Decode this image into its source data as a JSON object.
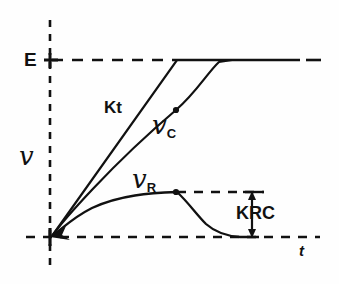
{
  "figure": {
    "background_color": "#fefefe",
    "ink_color": "#111111",
    "width": 339,
    "height": 284
  },
  "axes": {
    "y_axis": {
      "name": "vertical-dashed-axis",
      "label": "℘",
      "label_text": "v",
      "style": "dashed",
      "x": 50,
      "y_top": 20,
      "y_bottom": 268
    },
    "x_axis": {
      "name": "horizontal-dashed-axis",
      "label": "t",
      "style": "dashed",
      "y": 237,
      "x_left": 26,
      "x_right": 320
    },
    "ticks": [
      {
        "name": "tick-E",
        "label": "E",
        "value_y": 60
      },
      {
        "name": "tick-origin",
        "label": "",
        "value_y": 237
      }
    ]
  },
  "levels": {
    "E": {
      "label": "E",
      "y": 60,
      "dashed_from_x": 50,
      "dashed_to_x": 177,
      "solid_from_x": 177,
      "solid_to_x": 300,
      "tail_dash_from_x": 305,
      "tail_dash_to_x": 320
    },
    "VR_plateau": {
      "label": "",
      "y": 192,
      "dashed_from_x": 177,
      "dashed_to_x": 263
    }
  },
  "curves": [
    {
      "name": "kt-ramp-line",
      "label": "Kt",
      "label_x": 104,
      "label_y": 99,
      "description": "straight ramp of slope K, saturating at E",
      "points": [
        [
          52,
          236
        ],
        [
          177,
          60
        ],
        [
          300,
          60
        ]
      ],
      "marker": null
    },
    {
      "name": "vc-capacitor-curve",
      "label": "v_c",
      "label_base": "v",
      "label_sub": "C",
      "label_x": 152,
      "label_y": 112,
      "description": "capacitor voltage, lags the ramp by KRC then saturates at E",
      "points": [
        [
          52,
          236
        ],
        [
          90,
          193
        ],
        [
          130,
          152
        ],
        [
          176,
          110
        ],
        [
          200,
          85
        ],
        [
          217,
          63
        ],
        [
          230,
          60
        ],
        [
          300,
          60
        ]
      ],
      "marker": {
        "x": 176,
        "y": 110
      }
    },
    {
      "name": "vr-resistor-curve",
      "label": "v_R",
      "label_base": "v",
      "label_sub": "R",
      "label_x": 132,
      "label_y": 166,
      "description": "resistor voltage, exponential rise to KRC then exponential decay to zero",
      "points": [
        [
          52,
          236
        ],
        [
          72,
          219
        ],
        [
          95,
          207
        ],
        [
          125,
          198
        ],
        [
          155,
          193
        ],
        [
          177,
          192
        ],
        [
          190,
          203
        ],
        [
          200,
          216
        ],
        [
          212,
          229
        ],
        [
          225,
          235
        ],
        [
          240,
          237
        ],
        [
          258,
          237
        ]
      ],
      "marker": {
        "x": 176,
        "y": 192
      }
    }
  ],
  "annotations": [
    {
      "name": "krc-dimension-arrow",
      "label": "KRC",
      "label_x": 236,
      "label_y": 204,
      "arrow_x": 252,
      "arrow_top_y": 192,
      "arrow_bottom_y": 237,
      "cap_top_x1": 243,
      "cap_top_x2": 263,
      "description": "vertical double-headed arrow measuring the KRC offset"
    }
  ],
  "labels": {
    "E": "E",
    "v": "v",
    "Kt": "Kt",
    "v_c_base": "v",
    "v_c_sub": "C",
    "v_r_base": "v",
    "v_r_sub": "R",
    "KRC": "KRC",
    "t": "t"
  }
}
